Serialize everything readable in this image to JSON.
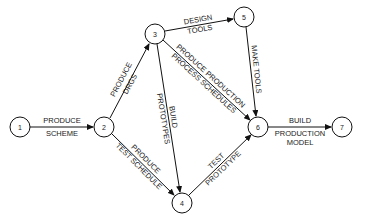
{
  "diagram": {
    "type": "activity-on-arrow network",
    "nodes": [
      {
        "id": "1",
        "label": "1"
      },
      {
        "id": "2",
        "label": "2"
      },
      {
        "id": "3",
        "label": "3"
      },
      {
        "id": "4",
        "label": "4"
      },
      {
        "id": "5",
        "label": "5"
      },
      {
        "id": "6",
        "label": "6"
      },
      {
        "id": "7",
        "label": "7"
      }
    ],
    "edges": [
      {
        "from": "1",
        "to": "2",
        "line1": "PRODUCE",
        "line2": "SCHEME"
      },
      {
        "from": "2",
        "to": "3",
        "line1": "PRODUCE",
        "line2": "DRGS"
      },
      {
        "from": "2",
        "to": "4",
        "line1": "PRODUCE",
        "line2": "TEST SCHEDULE"
      },
      {
        "from": "3",
        "to": "5",
        "line1": "DESIGN",
        "line2": "TOOLS"
      },
      {
        "from": "3",
        "to": "4",
        "line1": "BUILD",
        "line2": "PROTOTYPES"
      },
      {
        "from": "3",
        "to": "6",
        "line1": "PRODUCE PRODUCTION",
        "line2": "PROCESS SCHEDULES"
      },
      {
        "from": "5",
        "to": "6",
        "line1": "MAKE TOOLS",
        "line2": ""
      },
      {
        "from": "4",
        "to": "6",
        "line1": "TEST",
        "line2": "PROTOTYPE"
      },
      {
        "from": "6",
        "to": "7",
        "line1": "BUILD",
        "line2": "PRODUCTION"
      },
      {
        "from": "6",
        "to": "7b",
        "line1": "MODEL",
        "line2": ""
      }
    ]
  }
}
